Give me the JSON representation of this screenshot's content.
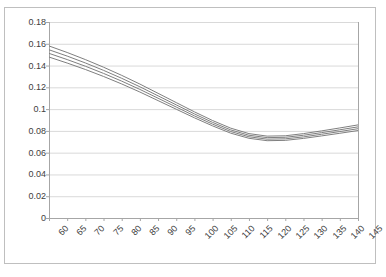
{
  "chart_data": {
    "type": "line",
    "title": "",
    "subtitle": "",
    "xlabel": "",
    "ylabel": "",
    "grid": true,
    "legend": false,
    "legend_position": "none",
    "background": "#ffffff",
    "line_color": "#808080",
    "frame_color": "#bfbfbf",
    "gridline_color": "#d9d9d9",
    "tick_color": "#a6a6a6",
    "text_color": "#404040",
    "xlim": [
      60,
      145
    ],
    "ylim": [
      0,
      0.18
    ],
    "ytick_step": 0.02,
    "xtick_step": 5,
    "categories": [
      60,
      65,
      70,
      75,
      80,
      85,
      90,
      95,
      100,
      105,
      110,
      115,
      120,
      125,
      130,
      135,
      140,
      145
    ],
    "x": [
      60,
      65,
      70,
      75,
      80,
      85,
      90,
      95,
      100,
      105,
      110,
      115,
      120,
      125,
      130,
      135,
      140,
      145
    ],
    "ytick_labels": [
      "0",
      "0.02",
      "0.04",
      "0.06",
      "0.08",
      "0.1",
      "0.12",
      "0.14",
      "0.16",
      "0.18"
    ],
    "ytick_values": [
      0,
      0.02,
      0.04,
      0.06,
      0.08,
      0.1,
      0.12,
      0.14,
      0.16,
      0.18
    ],
    "xtick_labels": [
      "60",
      "65",
      "70",
      "75",
      "80",
      "85",
      "90",
      "95",
      "100",
      "105",
      "110",
      "115",
      "120",
      "125",
      "130",
      "135",
      "140",
      "145"
    ],
    "series": [
      {
        "name": "series-1",
        "color": "#7f7f7f",
        "values": [
          0.158,
          0.152,
          0.1455,
          0.1385,
          0.131,
          0.123,
          0.1145,
          0.106,
          0.0975,
          0.0895,
          0.0825,
          0.0775,
          0.0752,
          0.0755,
          0.0775,
          0.08,
          0.0827,
          0.0855
        ]
      },
      {
        "name": "series-2",
        "color": "#7f7f7f",
        "values": [
          0.1545,
          0.1487,
          0.1424,
          0.1356,
          0.1283,
          0.1205,
          0.1122,
          0.1039,
          0.0956,
          0.0878,
          0.0809,
          0.076,
          0.0738,
          0.0741,
          0.076,
          0.0784,
          0.081,
          0.0837
        ]
      },
      {
        "name": "series-3",
        "color": "#7f7f7f",
        "values": [
          0.1512,
          0.1455,
          0.1394,
          0.1328,
          0.1257,
          0.1181,
          0.11,
          0.1019,
          0.0938,
          0.0862,
          0.0794,
          0.0746,
          0.0724,
          0.0727,
          0.0745,
          0.0769,
          0.0794,
          0.082
        ]
      },
      {
        "name": "series-4",
        "color": "#7f7f7f",
        "values": [
          0.1478,
          0.1423,
          0.1364,
          0.13,
          0.1231,
          0.1157,
          0.1078,
          0.0999,
          0.092,
          0.0846,
          0.0779,
          0.0732,
          0.071,
          0.0713,
          0.0731,
          0.0754,
          0.0778,
          0.0803
        ]
      }
    ]
  }
}
